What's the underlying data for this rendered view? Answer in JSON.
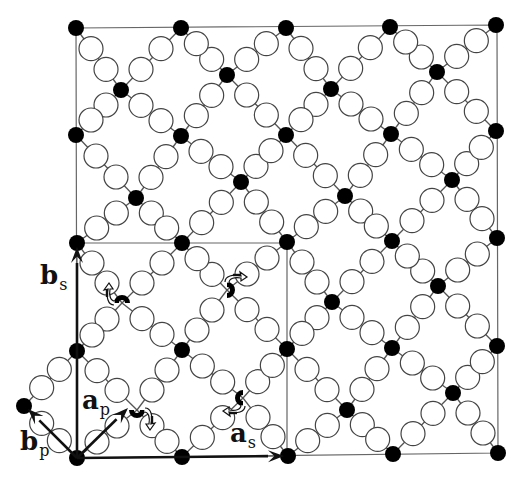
{
  "diagram": {
    "type": "modulated-lattice",
    "colors": {
      "background": "#ffffff",
      "line": "#555555",
      "frame": "#666666",
      "filled_atom": "#000000",
      "open_atom_fill": "#ffffff",
      "open_atom_stroke": "#444444",
      "vector": "#111111"
    },
    "frame": {
      "outer": [
        [
          76,
          28
        ],
        [
          497,
          25
        ],
        [
          498,
          453
        ],
        [
          77,
          458
        ]
      ],
      "inner_supercell": [
        [
          77,
          243
        ],
        [
          287,
          243
        ],
        [
          287,
          456
        ],
        [
          77,
          458
        ]
      ]
    },
    "corner_atoms": [
      [
        [
          76,
          28
        ],
        [
          181,
          28
        ],
        [
          286,
          28
        ],
        [
          390,
          27
        ],
        [
          496,
          25
        ]
      ],
      [
        [
          76,
          135
        ],
        [
          181,
          136
        ],
        [
          286,
          135
        ],
        [
          391,
          134
        ],
        [
          496,
          131
        ]
      ],
      [
        [
          77,
          243
        ],
        [
          182,
          243
        ],
        [
          287,
          242
        ],
        [
          392,
          241
        ],
        [
          497,
          238
        ]
      ],
      [
        [
          77,
          351
        ],
        [
          182,
          350
        ],
        [
          287,
          349
        ],
        [
          392,
          348
        ],
        [
          497,
          346
        ]
      ],
      [
        [
          77,
          458
        ],
        [
          182,
          457
        ],
        [
          288,
          456
        ],
        [
          393,
          454
        ],
        [
          498,
          453
        ]
      ]
    ],
    "center_atoms": [
      [
        [
          121,
          90
        ],
        [
          227,
          75
        ],
        [
          331,
          89
        ],
        [
          437,
          72
        ]
      ],
      [
        [
          136,
          198
        ],
        [
          241,
          182
        ],
        [
          345,
          196
        ],
        [
          452,
          180
        ]
      ],
      [
        [
          122,
          303
        ],
        [
          227,
          290
        ],
        [
          332,
          302
        ],
        [
          438,
          286
        ]
      ],
      [
        [
          137,
          410
        ],
        [
          243,
          398
        ],
        [
          347,
          410
        ],
        [
          453,
          393
        ]
      ]
    ],
    "rotated_atoms": [
      {
        "cell": [
          2,
          0
        ],
        "arrow": "up-left"
      },
      {
        "cell": [
          2,
          1
        ],
        "arrow": "down-left"
      },
      {
        "cell": [
          3,
          0
        ],
        "arrow": "down-right"
      },
      {
        "cell": [
          3,
          1
        ],
        "arrow": "up-right"
      }
    ],
    "extra_atom": {
      "pos": [
        24,
        406
      ],
      "bonds_to": [
        [
          77,
          351
        ],
        [
          77,
          458
        ]
      ]
    },
    "vectors": [
      {
        "id": "a_s",
        "from": [
          77,
          458
        ],
        "to": [
          284,
          456
        ],
        "label": "a",
        "sub": "s",
        "label_pos": [
          230,
          420
        ]
      },
      {
        "id": "b_s",
        "from": [
          77,
          458
        ],
        "to": [
          77,
          247
        ],
        "label": "b",
        "sub": "s",
        "label_pos": [
          40,
          262
        ]
      },
      {
        "id": "a_p",
        "from": [
          77,
          458
        ],
        "to": [
          128,
          408
        ],
        "label": "a",
        "sub": "p",
        "label_pos": [
          82,
          387
        ]
      },
      {
        "id": "b_p",
        "from": [
          77,
          458
        ],
        "to": [
          28,
          409
        ],
        "label": "b",
        "sub": "p",
        "label_pos": [
          20,
          428
        ]
      }
    ]
  }
}
